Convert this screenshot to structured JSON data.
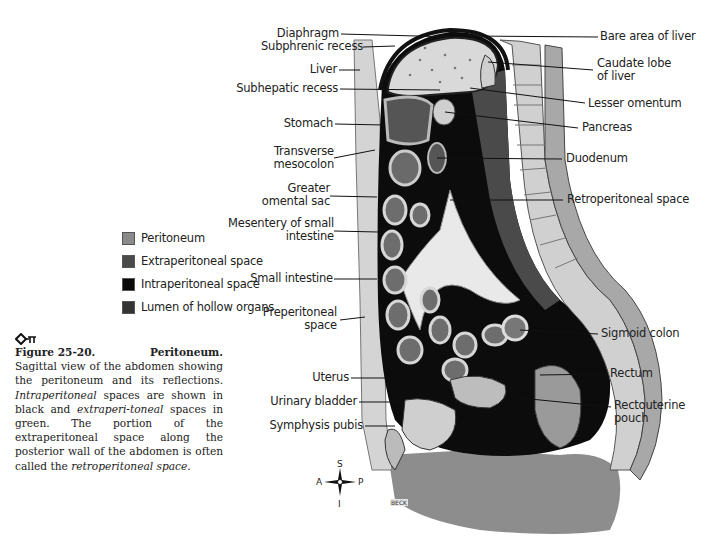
{
  "figure": {
    "number_label": "Figure 25-20.",
    "title": "Peritoneum.",
    "key_icon": "key-pi-icon",
    "caption_parts": [
      {
        "text": "Sagittal view of the abdomen showing the peritoneum and its reflections. ",
        "italic": false
      },
      {
        "text": "Intraperitoneal",
        "italic": true
      },
      {
        "text": " spaces are shown in black and ",
        "italic": false
      },
      {
        "text": "extraperi-toneal",
        "italic": true
      },
      {
        "text": " spaces in green. The portion of the extraperitoneal space along the posterior wall of the abdomen is often called the ",
        "italic": false
      },
      {
        "text": "retroperitoneal space",
        "italic": true
      },
      {
        "text": ".",
        "italic": false
      }
    ]
  },
  "legend": [
    {
      "label": "Peritoneum",
      "color": "#8a8a8a"
    },
    {
      "label": "Extraperitoneal space",
      "color": "#4a4a4a"
    },
    {
      "label": "Intraperitoneal space",
      "color": "#0a0a0a"
    },
    {
      "label": "Lumen of hollow organs",
      "color": "#333333"
    }
  ],
  "labels_left": [
    {
      "text": "Diaphragm"
    },
    {
      "text": "Subphrenic recess"
    },
    {
      "text": "Liver"
    },
    {
      "text": "Subhepatic recess"
    },
    {
      "text": "Stomach"
    },
    {
      "text": "Transverse\nmesocolon"
    },
    {
      "text": "Greater\nomental sac"
    },
    {
      "text": "Mesentery of small\nintestine"
    },
    {
      "text": "Small intestine"
    },
    {
      "text": "Preperitoneal\nspace"
    },
    {
      "text": "Uterus"
    },
    {
      "text": "Urinary bladder"
    },
    {
      "text": "Symphysis pubis"
    }
  ],
  "labels_right": [
    {
      "text": "Bare area of liver"
    },
    {
      "text": "Caudate lobe\nof liver"
    },
    {
      "text": "Lesser omentum"
    },
    {
      "text": "Pancreas"
    },
    {
      "text": "Duodenum"
    },
    {
      "text": "Retroperitoneal space"
    },
    {
      "text": "Sigmoid colon"
    },
    {
      "text": "Rectum"
    },
    {
      "text": "Rectouterine\npouch"
    }
  ],
  "compass": {
    "superior": "S",
    "inferior": "I",
    "anterior": "A",
    "posterior": "P"
  },
  "artist_signature": "BECK"
}
